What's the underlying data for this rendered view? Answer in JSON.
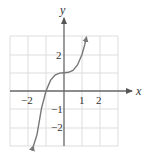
{
  "chart_data": {
    "type": "line",
    "title": "",
    "xlabel": "x",
    "ylabel": "y",
    "xlim": [
      -3,
      3
    ],
    "ylim": [
      -3,
      3
    ],
    "grid": true,
    "x_ticks": [
      -2,
      1,
      2
    ],
    "x_tick_labels": [
      "−2",
      "1",
      "2"
    ],
    "y_ticks": [
      2,
      -1,
      -2
    ],
    "y_tick_labels": [
      "2",
      "−1",
      "−2"
    ],
    "series": [
      {
        "name": "y = x^3 + 1",
        "x": [
          -1.7,
          -1.5,
          -1.25,
          -1.0,
          -0.75,
          -0.5,
          -0.25,
          0,
          0.25,
          0.5,
          0.75,
          1.0,
          1.15,
          1.25
        ],
        "y": [
          -3.9,
          -2.38,
          -0.95,
          0,
          0.58,
          0.875,
          0.98,
          1,
          1.02,
          1.125,
          1.42,
          2,
          2.52,
          2.95
        ],
        "arrows": "both-ends"
      }
    ],
    "colors": {
      "curve": "#777777",
      "axes": "#666666",
      "grid": "#dddddd"
    }
  }
}
